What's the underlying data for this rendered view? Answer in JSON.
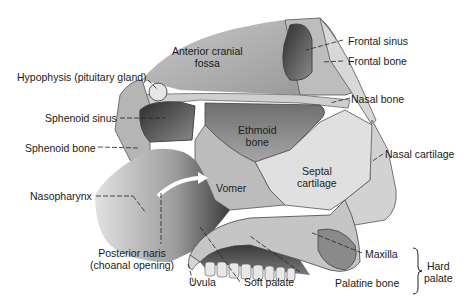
{
  "diagram": {
    "labels": {
      "anterior_cranial_fossa": "Anterior cranial\nfossa",
      "frontal_sinus": "Frontal sinus",
      "frontal_bone": "Frontal bone",
      "hypophysis": "Hypophysis (pituitary gland)",
      "nasal_bone": "Nasal bone",
      "sphenoid_sinus": "Sphenoid sinus",
      "ethmoid_bone": "Ethmoid\nbone",
      "sphenoid_bone": "Sphenoid bone",
      "nasal_cartilage": "Nasal cartilage",
      "septal_cartilage": "Septal\ncartilage",
      "nasopharynx": "Nasopharynx",
      "vomer": "Vomer",
      "posterior_naris": "Posterior naris\n(choanal opening)",
      "maxilla": "Maxilla",
      "hard_palate": "Hard\npalate",
      "uvula": "Uvula",
      "soft_palate": "Soft palate",
      "palatine_bone": "Palatine bone"
    },
    "colors": {
      "background": "#ffffff",
      "tissue_light": "#d9d9d9",
      "tissue_mid": "#a8a8a8",
      "tissue_dark": "#4a4a4a",
      "leader_line": "#222222"
    }
  }
}
